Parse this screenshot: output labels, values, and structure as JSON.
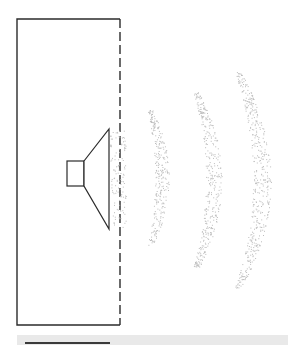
{
  "diagram": {
    "colors": {
      "line": "#2b2b2b",
      "wave_dots": "#bdbdbd",
      "bottom_bar": "#e9e9e9"
    },
    "parts": [
      "enclosure",
      "open-side",
      "speaker-magnet",
      "speaker-cone",
      "sound-wave-1",
      "sound-wave-2",
      "sound-wave-3"
    ]
  }
}
